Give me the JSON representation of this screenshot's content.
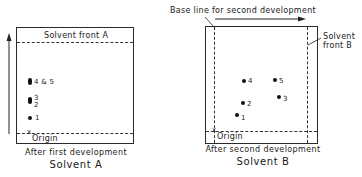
{
  "panel_a": {
    "solvent_front_label": "Solvent front A",
    "origin_label": "Origin",
    "origin_marker": "x",
    "caption": "After first development",
    "title": "Solvent A",
    "spots": [
      {
        "label": "4 & 5"
      },
      {
        "label_top": "3",
        "label_bottom": "2"
      },
      {
        "label": "1"
      }
    ]
  },
  "panel_b": {
    "base_line_label": "Base line for second development",
    "solvent_front_label_line1": "Solvent",
    "solvent_front_label_line2": "front B",
    "origin_label": "Origin",
    "origin_marker": "x",
    "caption": "After second development",
    "title": "Solvent B",
    "spots": [
      {
        "label": "1"
      },
      {
        "label": "2"
      },
      {
        "label": "3"
      },
      {
        "label": "4"
      },
      {
        "label": "5"
      }
    ]
  },
  "colors": {
    "ink": "#1a1a1a",
    "background": "#ffffff"
  }
}
